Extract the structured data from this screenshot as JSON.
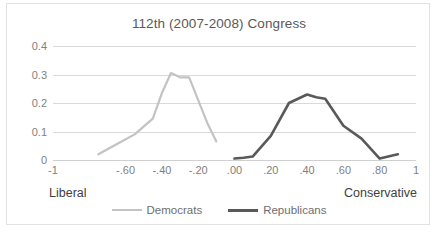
{
  "chart_data": {
    "type": "line",
    "title": "112th (2007-2008) Congress",
    "xlabel": "",
    "ylabel": "",
    "xlim": [
      -1,
      1
    ],
    "ylim": [
      0,
      0.4
    ],
    "grid": true,
    "legend_position": "bottom",
    "x_ticks": [
      "-1",
      "-.60",
      "-.40",
      "-.20",
      ".00",
      ".20",
      ".40",
      ".60",
      ".80",
      "1"
    ],
    "x_tick_values": [
      -1,
      -0.6,
      -0.4,
      -0.2,
      0.0,
      0.2,
      0.4,
      0.6,
      0.8,
      1
    ],
    "y_ticks": [
      "0",
      "0.1",
      "0.2",
      "0.3",
      "0.4"
    ],
    "y_tick_values": [
      0,
      0.1,
      0.2,
      0.3,
      0.4
    ],
    "axis_anchor_left": "Liberal",
    "axis_anchor_right": "Conservative",
    "series": [
      {
        "name": "Democrats",
        "color": "#c3c3c3",
        "x": [
          -0.75,
          -0.65,
          -0.55,
          -0.45,
          -0.4,
          -0.35,
          -0.3,
          -0.25,
          -0.2,
          -0.15,
          -0.1
        ],
        "values": [
          0.02,
          0.055,
          0.09,
          0.145,
          0.235,
          0.305,
          0.29,
          0.29,
          0.21,
          0.13,
          0.065
        ]
      },
      {
        "name": "Republicans",
        "color": "#595959",
        "x": [
          0.0,
          0.05,
          0.1,
          0.2,
          0.3,
          0.35,
          0.4,
          0.45,
          0.5,
          0.6,
          0.7,
          0.8,
          0.9
        ],
        "values": [
          0.005,
          0.008,
          0.012,
          0.085,
          0.2,
          0.215,
          0.23,
          0.22,
          0.215,
          0.12,
          0.075,
          0.005,
          0.02
        ]
      }
    ]
  },
  "legend": {
    "items": [
      {
        "label": "Democrats",
        "color": "#c3c3c3",
        "width": 2
      },
      {
        "label": "Republicans",
        "color": "#595959",
        "width": 3
      }
    ]
  }
}
